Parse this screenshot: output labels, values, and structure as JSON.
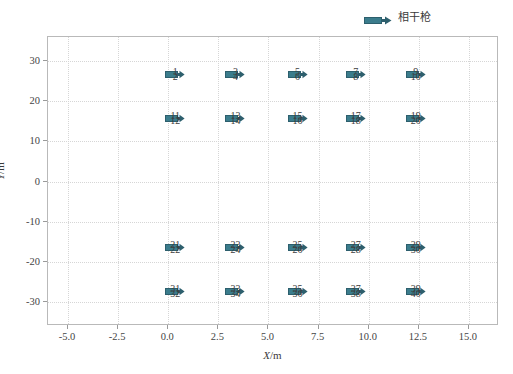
{
  "chart": {
    "type": "scatter",
    "title": "",
    "xlabel_symbol": "X",
    "xlabel_unit": "/m",
    "ylabel_symbol": "Y",
    "ylabel_unit": "/m",
    "xlim": [
      -6.0,
      16.5
    ],
    "ylim": [
      -36.0,
      36.0
    ],
    "xticks": [
      "-5.0",
      "-2.5",
      "0.0",
      "2.5",
      "5.0",
      "7.5",
      "10.0",
      "12.5",
      "15.0"
    ],
    "xtick_values": [
      -5.0,
      -2.5,
      0.0,
      2.5,
      5.0,
      7.5,
      10.0,
      12.5,
      15.0
    ],
    "yticks": [
      "30",
      "20",
      "10",
      "0",
      "-10",
      "-20",
      "-30"
    ],
    "ytick_values": [
      30,
      20,
      10,
      0,
      -10,
      -20,
      -30
    ],
    "grid": true,
    "grid_color": "#d6d6d6",
    "frame_color": "#b9b9b9",
    "marker_color": "#3b7c8c",
    "marker_edge_color": "#2d5f6d",
    "background": "#ffffff"
  },
  "legend": {
    "position": "top-center-right",
    "label": "相干枪",
    "marker_name": "coherent-gun-arrow-marker"
  },
  "chart_data": {
    "type": "scatter",
    "title": "",
    "xlabel": "X/m",
    "ylabel": "Y/m",
    "xlim": [
      -6.0,
      16.5
    ],
    "ylim": [
      -36.0,
      36.0
    ],
    "grid": true,
    "legend": [
      "相干枪"
    ],
    "series": [
      {
        "name": "相干枪",
        "points": [
          {
            "labels": [
              "1",
              "2"
            ],
            "x": 0.4,
            "y": 26.5
          },
          {
            "labels": [
              "3",
              "4"
            ],
            "x": 3.4,
            "y": 26.5
          },
          {
            "labels": [
              "5",
              "6"
            ],
            "x": 6.5,
            "y": 26.5
          },
          {
            "labels": [
              "7",
              "8"
            ],
            "x": 9.4,
            "y": 26.5
          },
          {
            "labels": [
              "9",
              "10"
            ],
            "x": 12.4,
            "y": 26.5
          },
          {
            "labels": [
              "11",
              "12"
            ],
            "x": 0.4,
            "y": 15.5
          },
          {
            "labels": [
              "13",
              "14"
            ],
            "x": 3.4,
            "y": 15.5
          },
          {
            "labels": [
              "15",
              "16"
            ],
            "x": 6.5,
            "y": 15.5
          },
          {
            "labels": [
              "17",
              "18"
            ],
            "x": 9.4,
            "y": 15.5
          },
          {
            "labels": [
              "19",
              "20"
            ],
            "x": 12.4,
            "y": 15.5
          },
          {
            "labels": [
              "21",
              "22"
            ],
            "x": 0.4,
            "y": -16.5
          },
          {
            "labels": [
              "23",
              "24"
            ],
            "x": 3.4,
            "y": -16.5
          },
          {
            "labels": [
              "25",
              "26"
            ],
            "x": 6.5,
            "y": -16.5
          },
          {
            "labels": [
              "27",
              "28"
            ],
            "x": 9.4,
            "y": -16.5
          },
          {
            "labels": [
              "29",
              "30"
            ],
            "x": 12.4,
            "y": -16.5
          },
          {
            "labels": [
              "31",
              "32"
            ],
            "x": 0.4,
            "y": -27.5
          },
          {
            "labels": [
              "33",
              "34"
            ],
            "x": 3.4,
            "y": -27.5
          },
          {
            "labels": [
              "35",
              "36"
            ],
            "x": 6.5,
            "y": -27.5
          },
          {
            "labels": [
              "37",
              "38"
            ],
            "x": 9.4,
            "y": -27.5
          },
          {
            "labels": [
              "39",
              "40"
            ],
            "x": 12.4,
            "y": -27.5
          }
        ]
      }
    ]
  }
}
